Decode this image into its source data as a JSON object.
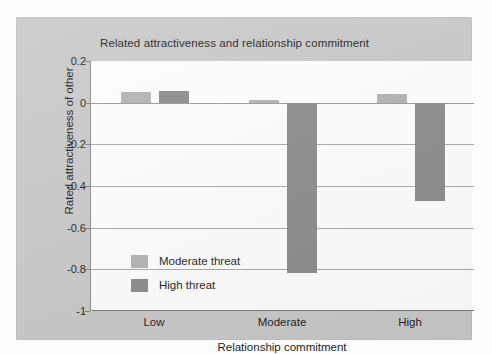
{
  "chart_data": {
    "type": "bar",
    "title": "Related attractiveness and relationship commitment",
    "xlabel": "Relationship commitment",
    "ylabel": "Rated attractiveness of other",
    "categories": [
      "Low",
      "Moderate",
      "High"
    ],
    "series": [
      {
        "name": "Moderate threat",
        "color": "#b3b3b3",
        "values": [
          0.05,
          0.015,
          0.04
        ]
      },
      {
        "name": "High threat",
        "color": "#8c8c8c",
        "values": [
          0.055,
          -0.82,
          -0.47
        ]
      }
    ],
    "ylim": [
      -1,
      0.2
    ],
    "yticks": [
      0.2,
      0,
      -0.2,
      -0.4,
      -0.6,
      -0.8,
      -1
    ],
    "ytick_labels": [
      "0.2",
      "0",
      "-0.2",
      "-0.4",
      "-0.6",
      "-0.8",
      "-1"
    ],
    "grid": true,
    "legend_position": "inside-lower-left",
    "background_color": "#c9c9c9",
    "plot_background_color": "#ffffff"
  }
}
